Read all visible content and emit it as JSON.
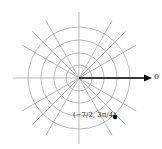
{
  "diagram": {
    "type": "polar-grid",
    "center": [
      79,
      78
    ],
    "circle_radii": [
      13,
      25,
      38,
      51
    ],
    "radial_line_length": 66,
    "radial_angles_deg": [
      0,
      30,
      45,
      60,
      90,
      120,
      135,
      150,
      180,
      210,
      225,
      240,
      270,
      300,
      315,
      330
    ],
    "grid_color": "#aaaaaa",
    "polar_axis": {
      "label": "0",
      "end": [
        152,
        78
      ]
    },
    "point": {
      "label": "(−7/2, 3π/4)",
      "r": "-7/2",
      "theta": "3π/4",
      "pos": [
        115,
        117
      ]
    }
  }
}
